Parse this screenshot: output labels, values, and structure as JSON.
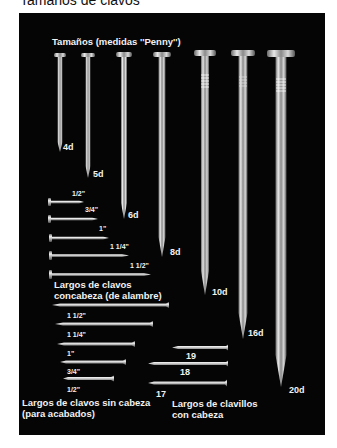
{
  "document": {
    "title": "Tamaños de clavos"
  },
  "panel": {
    "header": "Tamaños (medidas ''Penny'')",
    "penny_nails": [
      {
        "label": "4d"
      },
      {
        "label": "5d"
      },
      {
        "label": "6d"
      },
      {
        "label": "8d"
      },
      {
        "label": "10d"
      },
      {
        "label": "16d"
      },
      {
        "label": "20d"
      }
    ],
    "wire_nails": {
      "caption_line1": "Largos de clavos",
      "caption_line2": "concabeza (de alambre)",
      "sizes": [
        "1/2\"",
        "3/4\"",
        "1\"",
        "1 1/4\"",
        "1 1/2\""
      ]
    },
    "finishing_nails": {
      "caption_line1": "Largos de clavos sin cabeza",
      "caption_line2": "(para acabados)",
      "sizes": [
        "1 1/2\"",
        "1 1/4\"",
        "1\"",
        "3/4\"",
        "1/2\""
      ]
    },
    "brads": {
      "caption_line1": "Largos de clavillos",
      "caption_line2": "con cabeza",
      "sizes": [
        "19",
        "18",
        "17"
      ]
    }
  },
  "colors": {
    "background": "#ffffff",
    "panel": "#050505",
    "text_on_panel": "#f2f2f2",
    "nail_metal": "#c8c8c8"
  }
}
